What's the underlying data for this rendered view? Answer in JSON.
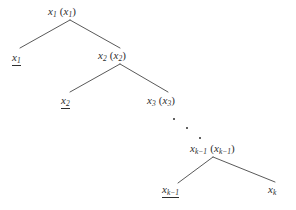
{
  "figure": {
    "type": "binary-tree-diagram",
    "background_color": "#ffffff",
    "stroke_color": "#2e2e2e",
    "text_color": "#2e2e2e"
  },
  "nodes": {
    "root": {
      "id": "node-x1-internal",
      "symbol": "x",
      "subscript": "1",
      "paren_open": "(",
      "paren_close": ")",
      "paren_symbol": "x",
      "paren_subscript": "1",
      "underlined": false,
      "x": 48,
      "y": 6
    },
    "leaf_x1": {
      "id": "node-x1-leaf",
      "symbol": "x",
      "subscript": "1",
      "underlined": true,
      "x": 12,
      "y": 52
    },
    "internal_x2": {
      "id": "node-x2-internal",
      "symbol": "x",
      "subscript": "2",
      "paren_open": "(",
      "paren_close": ")",
      "paren_symbol": "x",
      "paren_subscript": "2",
      "underlined": false,
      "x": 98,
      "y": 50
    },
    "leaf_x2": {
      "id": "node-x2-leaf",
      "symbol": "x",
      "subscript": "2",
      "underlined": true,
      "x": 61,
      "y": 95
    },
    "internal_x3": {
      "id": "node-x3-internal",
      "symbol": "x",
      "subscript": "3",
      "paren_open": "(",
      "paren_close": ")",
      "paren_symbol": "x",
      "paren_subscript": "3",
      "underlined": false,
      "x": 147,
      "y": 95
    },
    "internal_xk1": {
      "id": "node-xk-1-internal",
      "symbol": "x",
      "subscript": "k−1",
      "paren_open": "(",
      "paren_close": ")",
      "paren_symbol": "x",
      "paren_subscript": "k−1",
      "underlined": false,
      "x": 190,
      "y": 143
    },
    "leaf_xk1": {
      "id": "node-xk-1-leaf",
      "symbol": "x",
      "subscript": "k−1",
      "underlined": true,
      "x": 162,
      "y": 184
    },
    "leaf_xk": {
      "id": "node-xk-leaf",
      "symbol": "x",
      "subscript": "k",
      "underlined": false,
      "x": 268,
      "y": 184
    }
  },
  "ellipsis_dots": [
    {
      "x": 173,
      "y": 118
    },
    {
      "x": 186,
      "y": 127
    },
    {
      "x": 199,
      "y": 137
    }
  ],
  "edges": [
    {
      "name": "edge-root-to-leaf-x1",
      "x1": 70,
      "y1": 20,
      "x2": 20,
      "y2": 48
    },
    {
      "name": "edge-root-to-x2",
      "x1": 70,
      "y1": 20,
      "x2": 120,
      "y2": 48
    },
    {
      "name": "edge-x2-to-leaf-x2",
      "x1": 120,
      "y1": 64,
      "x2": 70,
      "y2": 92
    },
    {
      "name": "edge-x2-to-x3",
      "x1": 120,
      "y1": 64,
      "x2": 168,
      "y2": 92
    },
    {
      "name": "edge-xk1-to-leaf-xk1",
      "x1": 213,
      "y1": 157,
      "x2": 178,
      "y2": 183
    },
    {
      "name": "edge-xk1-to-leaf-xk",
      "x1": 213,
      "y1": 157,
      "x2": 275,
      "y2": 182
    }
  ]
}
